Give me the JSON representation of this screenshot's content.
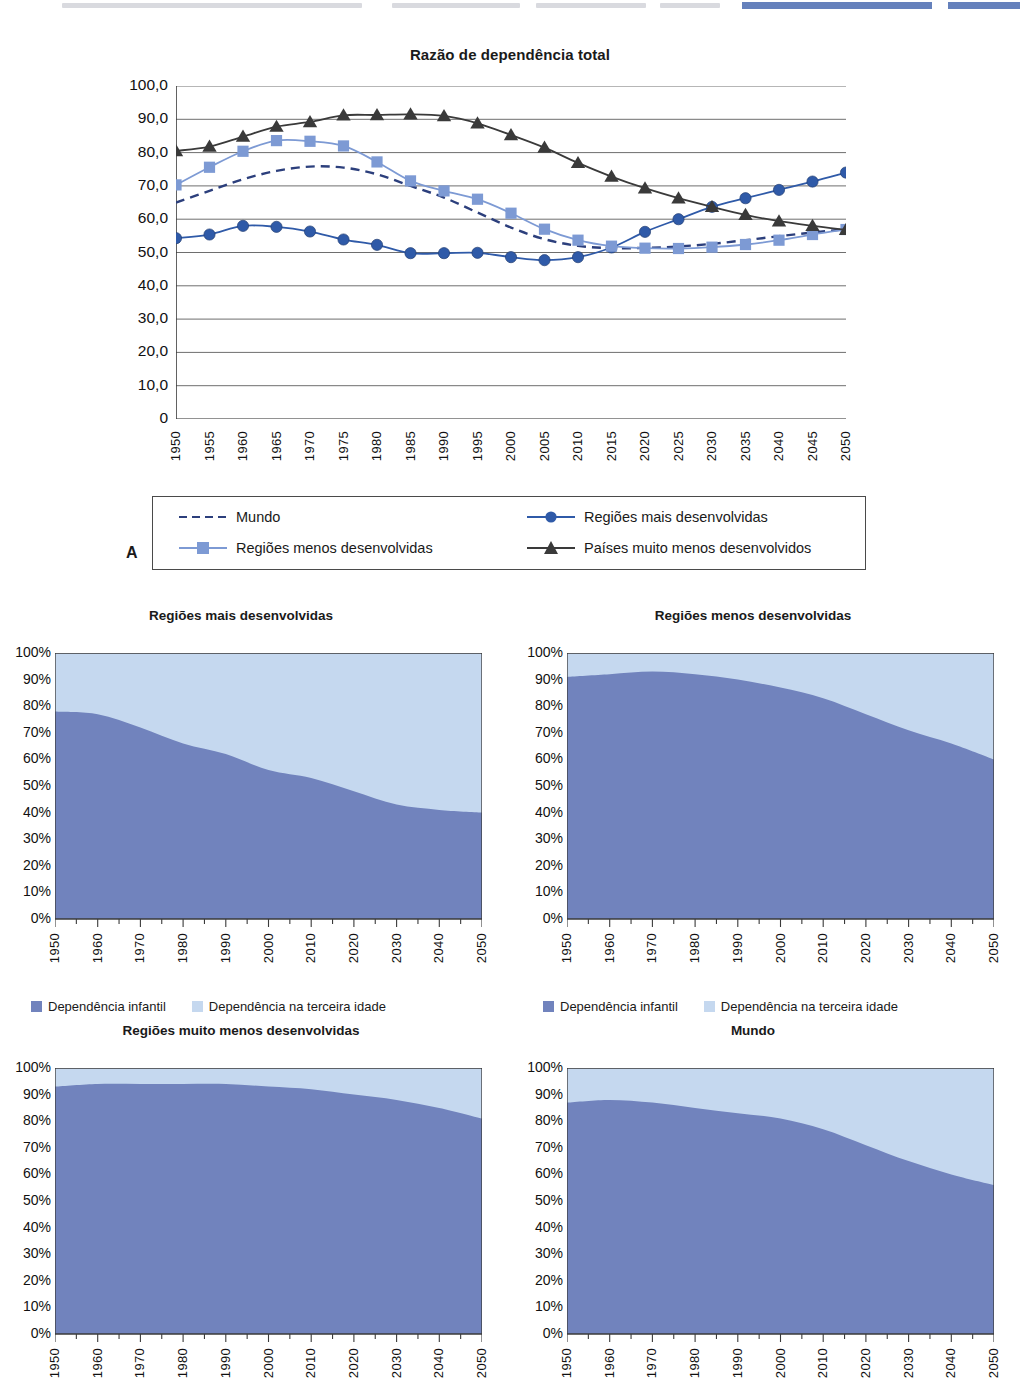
{
  "main": {
    "title": "Razão de dependência total",
    "panel_label": "A",
    "y_ticks": [
      "100,0",
      "90,0",
      "80,0",
      "70,0",
      "60,0",
      "50,0",
      "40,0",
      "30,0",
      "20,0",
      "10,0",
      "0"
    ],
    "x_ticks": [
      "1950",
      "1955",
      "1960",
      "1965",
      "1970",
      "1975",
      "1980",
      "1985",
      "1990",
      "1995",
      "2000",
      "2005",
      "2010",
      "2015",
      "2020",
      "2025",
      "2030",
      "2035",
      "2040",
      "2045",
      "2050"
    ],
    "legend": [
      {
        "label": "Mundo",
        "marker": "dashed-line",
        "color": "#2c3f7c"
      },
      {
        "label": "Regiões mais desenvolvidas",
        "marker": "circle",
        "color": "#2f5aa8"
      },
      {
        "label": "Regiões menos desenvolvidas",
        "marker": "square",
        "color": "#7d9ad4"
      },
      {
        "label": "Países muito menos desenvolvidos",
        "marker": "triangle",
        "color": "#3a3a3a"
      }
    ]
  },
  "area_legend": {
    "child_label": "Dependência infantil",
    "elderly_label": "Dependência na terceira idade",
    "child_color": "#7183bd",
    "elderly_color": "#c5d8ef"
  },
  "area_axis": {
    "y_ticks": [
      "100%",
      "90%",
      "80%",
      "70%",
      "60%",
      "50%",
      "40%",
      "30%",
      "20%",
      "10%",
      "0%"
    ],
    "x_ticks": [
      "1950",
      "1960",
      "1970",
      "1980",
      "1990",
      "2000",
      "2010",
      "2020",
      "2030",
      "2040",
      "2050"
    ]
  },
  "chart_data": [
    {
      "type": "line",
      "title": "Razão de dependência total",
      "xlabel": "",
      "ylabel": "",
      "ylim": [
        0,
        100
      ],
      "grid": true,
      "legend_position": "bottom",
      "x": [
        1950,
        1955,
        1960,
        1965,
        1970,
        1975,
        1980,
        1985,
        1990,
        1995,
        2000,
        2005,
        2010,
        2015,
        2020,
        2025,
        2030,
        2035,
        2040,
        2045,
        2050
      ],
      "series": [
        {
          "name": "Mundo",
          "marker": "none",
          "style": "dashed",
          "color": "#2c3f7c",
          "values": [
            65.0,
            68.5,
            72.0,
            74.5,
            75.8,
            75.5,
            73.5,
            70.0,
            66.5,
            62.0,
            57.5,
            54.0,
            52.0,
            51.3,
            51.4,
            51.8,
            52.6,
            53.7,
            54.9,
            56.0,
            57.0
          ]
        },
        {
          "name": "Regiões mais desenvolvidas",
          "marker": "circle",
          "style": "solid",
          "color": "#2f5aa8",
          "values": [
            54.3,
            55.4,
            58.0,
            57.7,
            56.3,
            53.9,
            52.3,
            49.8,
            49.8,
            49.9,
            48.6,
            47.7,
            48.6,
            51.5,
            56.2,
            60.0,
            63.7,
            66.3,
            68.8,
            71.3,
            74.0
          ]
        },
        {
          "name": "Regiões menos desenvolvidas",
          "marker": "square",
          "style": "solid",
          "color": "#7d9ad4",
          "values": [
            70.3,
            75.6,
            80.4,
            83.6,
            83.4,
            82.0,
            77.2,
            71.5,
            68.5,
            66.0,
            61.8,
            57.0,
            53.7,
            51.9,
            51.3,
            51.2,
            51.6,
            52.4,
            53.7,
            55.4,
            56.9
          ]
        },
        {
          "name": "Países muito menos desenvolvidos",
          "marker": "triangle",
          "style": "solid",
          "color": "#3a3a3a",
          "values": [
            80.5,
            81.8,
            84.8,
            87.8,
            89.2,
            91.2,
            91.3,
            91.5,
            91.0,
            88.8,
            85.3,
            81.5,
            76.9,
            72.8,
            69.3,
            66.3,
            63.7,
            61.3,
            59.4,
            58.0,
            56.8
          ]
        }
      ]
    },
    {
      "type": "area",
      "stacked": true,
      "title": "Regiões mais desenvolvidas",
      "ylim": [
        0,
        100
      ],
      "ylabel": "",
      "x": [
        1950,
        1960,
        1970,
        1980,
        1990,
        2000,
        2010,
        2020,
        2030,
        2040,
        2050
      ],
      "series": [
        {
          "name": "Dependência infantil",
          "color": "#7183bd",
          "values": [
            78,
            77,
            72,
            66,
            62,
            56,
            53,
            48,
            43,
            41,
            40
          ]
        },
        {
          "name": "Dependência na terceira idade",
          "color": "#c5d8ef",
          "values": [
            22,
            23,
            28,
            34,
            38,
            44,
            47,
            52,
            57,
            59,
            60
          ]
        }
      ]
    },
    {
      "type": "area",
      "stacked": true,
      "title": "Regiões menos desenvolvidas",
      "ylim": [
        0,
        100
      ],
      "ylabel": "",
      "x": [
        1950,
        1960,
        1970,
        1980,
        1990,
        2000,
        2010,
        2020,
        2030,
        2040,
        2050
      ],
      "series": [
        {
          "name": "Dependência infantil",
          "color": "#7183bd",
          "values": [
            91,
            92,
            93,
            92,
            90,
            87,
            83,
            77,
            71,
            66,
            60
          ]
        },
        {
          "name": "Dependência na terceira idade",
          "color": "#c5d8ef",
          "values": [
            9,
            8,
            7,
            8,
            10,
            13,
            17,
            23,
            29,
            34,
            40
          ]
        }
      ]
    },
    {
      "type": "area",
      "stacked": true,
      "title": "Regiões muito menos desenvolvidas",
      "ylim": [
        0,
        100
      ],
      "ylabel": "",
      "x": [
        1950,
        1960,
        1970,
        1980,
        1990,
        2000,
        2010,
        2020,
        2030,
        2040,
        2050
      ],
      "series": [
        {
          "name": "Dependência infantil",
          "color": "#7183bd",
          "values": [
            93,
            94,
            94,
            94,
            94,
            93,
            92,
            90,
            88,
            85,
            81
          ]
        },
        {
          "name": "Dependência na terceira idade",
          "color": "#c5d8ef",
          "values": [
            7,
            6,
            6,
            6,
            6,
            7,
            8,
            10,
            12,
            15,
            19
          ]
        }
      ]
    },
    {
      "type": "area",
      "stacked": true,
      "title": "Mundo",
      "ylim": [
        0,
        100
      ],
      "ylabel": "",
      "x": [
        1950,
        1960,
        1970,
        1980,
        1990,
        2000,
        2010,
        2020,
        2030,
        2040,
        2050
      ],
      "series": [
        {
          "name": "Dependência infantil",
          "color": "#7183bd",
          "values": [
            87,
            88,
            87,
            85,
            83,
            81,
            77,
            71,
            65,
            60,
            56
          ]
        },
        {
          "name": "Dependência na terceira idade",
          "color": "#c5d8ef",
          "values": [
            13,
            12,
            13,
            15,
            17,
            19,
            23,
            29,
            35,
            40,
            44
          ]
        }
      ]
    }
  ]
}
